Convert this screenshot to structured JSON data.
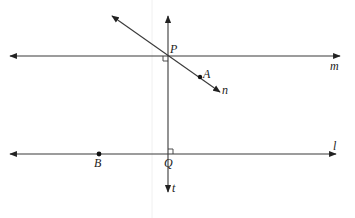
{
  "diagram": {
    "type": "geometry-figure",
    "colors": {
      "stroke": "#3a3a3a",
      "text": "#222222",
      "background": "#ffffff"
    },
    "lines": [
      {
        "id": "m",
        "label": "m",
        "kind": "horizontal",
        "role": "parallel line through P"
      },
      {
        "id": "l",
        "label": "l",
        "kind": "horizontal",
        "role": "parallel line through Q and B"
      },
      {
        "id": "t",
        "label": "t",
        "kind": "vertical",
        "role": "transversal perpendicular to m and l"
      },
      {
        "id": "n",
        "label": "n",
        "kind": "oblique",
        "role": "line through P and A"
      }
    ],
    "points": [
      {
        "id": "P",
        "label": "P",
        "on": [
          "m",
          "t",
          "n"
        ]
      },
      {
        "id": "Q",
        "label": "Q",
        "on": [
          "l",
          "t"
        ]
      },
      {
        "id": "A",
        "label": "A",
        "on": [
          "n"
        ]
      },
      {
        "id": "B",
        "label": "B",
        "on": [
          "l"
        ]
      }
    ],
    "right_angles": [
      {
        "at": "P",
        "between": [
          "m",
          "t"
        ]
      },
      {
        "at": "Q",
        "between": [
          "l",
          "t"
        ]
      }
    ]
  }
}
